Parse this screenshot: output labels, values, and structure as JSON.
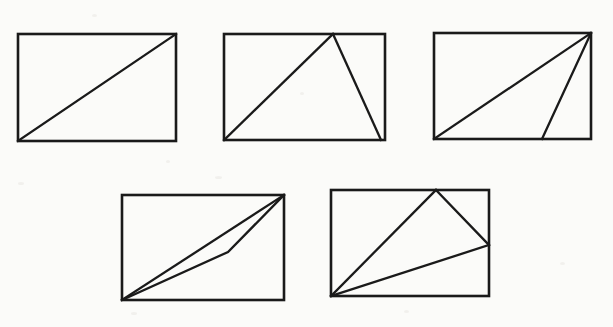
{
  "page": {
    "width": 613,
    "height": 327,
    "background_color": "#fbfbf9",
    "ink_color": "#1a1a1a"
  },
  "chart_data": {
    "type": "diagram",
    "subtitle": "",
    "xlabel": "",
    "ylabel": "",
    "grid": false,
    "legend": null,
    "annotations": [],
    "figure_count": 5,
    "rows": [
      {
        "row": 1,
        "figure_labels": [
          "figure-1",
          "figure-2",
          "figure-3"
        ]
      },
      {
        "row": 2,
        "figure_labels": [
          "figure-4",
          "figure-5"
        ]
      }
    ],
    "figures": [
      {
        "id": "figure-1",
        "name": "rectangle-with-diagonal",
        "description": "Rectangle divided by a single diagonal from bottom-left to top-right",
        "rect": {
          "x": 18,
          "y": 34,
          "width": 158,
          "height": 107
        },
        "vertices": {
          "top_left": [
            18,
            34
          ],
          "top_right": [
            176,
            34
          ],
          "bottom_right": [
            176,
            141
          ],
          "bottom_left": [
            18,
            141
          ]
        },
        "lines": [
          {
            "name": "diagonal",
            "points": [
              [
                18,
                141
              ],
              [
                176,
                34
              ]
            ]
          }
        ]
      },
      {
        "id": "figure-2",
        "name": "rectangle-with-apex-triangle",
        "description": "Triangle with apex on the top edge, base spanning the bottom edge",
        "rect": {
          "x": 224,
          "y": 34,
          "width": 161,
          "height": 106
        },
        "vertices": {
          "top_left": [
            224,
            34
          ],
          "top_right": [
            385,
            34
          ],
          "bottom_right": [
            385,
            140
          ],
          "bottom_left": [
            224,
            140
          ],
          "apex": [
            333,
            34
          ],
          "base_right": [
            381,
            140
          ]
        },
        "lines": [
          {
            "name": "left-leg",
            "points": [
              [
                224,
                140
              ],
              [
                333,
                34
              ]
            ]
          },
          {
            "name": "right-leg",
            "points": [
              [
                333,
                34
              ],
              [
                381,
                140
              ]
            ]
          }
        ]
      },
      {
        "id": "figure-3",
        "name": "rectangle-with-two-cevians",
        "description": "Two lines from the top-right corner: one to the bottom-left corner, one to a point on the bottom edge",
        "rect": {
          "x": 434,
          "y": 33,
          "width": 157,
          "height": 106
        },
        "vertices": {
          "top_left": [
            434,
            33
          ],
          "top_right": [
            591,
            33
          ],
          "bottom_right": [
            591,
            139
          ],
          "bottom_left": [
            434,
            139
          ],
          "base_point": [
            542,
            139
          ]
        },
        "lines": [
          {
            "name": "diagonal",
            "points": [
              [
                434,
                139
              ],
              [
                591,
                33
              ]
            ]
          },
          {
            "name": "cevian",
            "points": [
              [
                591,
                33
              ],
              [
                542,
                139
              ]
            ]
          }
        ]
      },
      {
        "id": "figure-4",
        "name": "rectangle-with-sliver-triangle",
        "description": "Thin sliver between the diagonal and a bent two-segment path sharing the same endpoints",
        "rect": {
          "x": 122,
          "y": 195,
          "width": 162,
          "height": 105
        },
        "vertices": {
          "top_left": [
            122,
            195
          ],
          "top_right": [
            284,
            195
          ],
          "bottom_right": [
            284,
            300
          ],
          "bottom_left": [
            122,
            300
          ],
          "bend_point": [
            228,
            252
          ]
        },
        "lines": [
          {
            "name": "diagonal",
            "points": [
              [
                122,
                300
              ],
              [
                284,
                195
              ]
            ]
          },
          {
            "name": "bent-path",
            "points": [
              [
                122,
                300
              ],
              [
                228,
                252
              ],
              [
                284,
                195
              ]
            ]
          }
        ]
      },
      {
        "id": "figure-5",
        "name": "rectangle-with-corner-fan-triangle",
        "description": "Triangle from the bottom-left corner to an apex on the top edge and a point on the right edge",
        "rect": {
          "x": 331,
          "y": 190,
          "width": 158,
          "height": 106
        },
        "vertices": {
          "top_left": [
            331,
            190
          ],
          "top_right": [
            489,
            190
          ],
          "bottom_right": [
            489,
            296
          ],
          "bottom_left": [
            331,
            296
          ],
          "apex": [
            436,
            190
          ],
          "right_point": [
            489,
            245
          ]
        },
        "lines": [
          {
            "name": "left-leg",
            "points": [
              [
                331,
                296
              ],
              [
                436,
                190
              ]
            ]
          },
          {
            "name": "right-leg",
            "points": [
              [
                436,
                190
              ],
              [
                489,
                245
              ]
            ]
          },
          {
            "name": "base-leg",
            "points": [
              [
                489,
                245
              ],
              [
                331,
                296
              ]
            ]
          }
        ]
      }
    ]
  }
}
